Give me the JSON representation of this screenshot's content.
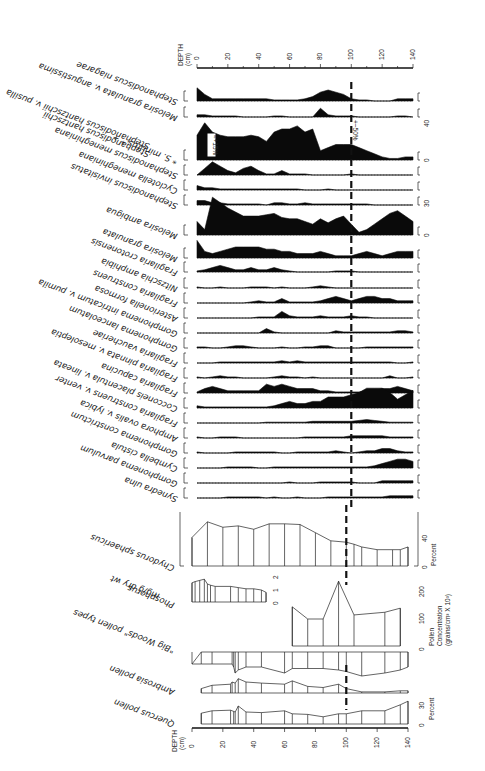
{
  "figure": {
    "orientation": "rotated 180 degrees",
    "depth_axis_label": "DEPTH",
    "depth_axis_unit": "(cm)",
    "depth_ticks": [
      "0",
      "20",
      "40",
      "60",
      "80",
      "100",
      "120",
      "140"
    ],
    "marker_depth": 100,
    "annotation_main": "+~50%",
    "annotation_box": "≈+15%",
    "percent_label": "Percent",
    "pollen_conc_label_1": "Pollen",
    "pollen_conc_label_2": "Concentration",
    "pollen_conc_label_3": "(grains/cm³ X 10³)"
  },
  "chart_data": {
    "type": "area",
    "xlabel": "DEPTH (cm)",
    "xlim": [
      0,
      140
    ],
    "depths": [
      0,
      5,
      10,
      15,
      20,
      25,
      30,
      35,
      40,
      45,
      50,
      55,
      60,
      65,
      70,
      75,
      80,
      85,
      90,
      95,
      100,
      105,
      110,
      115,
      120,
      125,
      130,
      135,
      140
    ],
    "diatoms": [
      {
        "name": "Stephanodiscus niagarae",
        "values": [
          6,
          3,
          1,
          1,
          1,
          1,
          1,
          1,
          1,
          1,
          0.5,
          0.5,
          0.5,
          0.5,
          1,
          2,
          4,
          5,
          4,
          3,
          1,
          0.5,
          0.5,
          0,
          0,
          0,
          1,
          1,
          1
        ]
      },
      {
        "name": "Melosira granulata v. angustissima",
        "values": [
          1,
          1,
          0.5,
          0.5,
          0.5,
          0.5,
          0,
          0,
          0,
          0,
          0.5,
          0.5,
          0,
          0,
          0,
          0,
          4,
          1,
          0.5,
          0.5,
          0.5,
          0,
          0,
          0,
          0,
          0,
          0.5,
          0.5,
          0
        ]
      },
      {
        "name": "* S. minutus * +",
        "values": [
          16,
          24,
          18,
          16,
          15,
          15,
          15,
          16,
          15,
          12,
          18,
          20,
          20,
          22,
          18,
          20,
          6,
          8,
          10,
          10,
          10,
          8,
          6,
          4,
          2,
          1,
          1,
          2,
          2
        ]
      },
      {
        "name": "Stephanodiscus hantzschii",
        "values": []
      },
      {
        "name": "Stephanodiscus hantzschii v. pusilla",
        "values": []
      },
      {
        "name": "Stephanodiscus meneghiniana",
        "values": [
          0,
          3,
          6,
          4,
          2,
          1,
          3,
          4,
          2,
          0.5,
          0.5,
          2,
          0.5,
          0.5,
          0.5,
          0,
          0,
          0,
          0,
          0,
          0.5,
          0,
          0,
          0,
          0,
          0,
          0,
          0,
          0
        ]
      },
      {
        "name": "Cyclotella meneghiniana",
        "values": [
          2,
          1,
          1,
          0.5,
          0.5,
          0.5,
          0.5,
          0.5,
          0.5,
          0.5,
          0.5,
          0.5,
          0.5,
          0.5,
          0,
          0,
          0,
          0.5,
          0,
          0,
          0,
          0,
          0,
          0,
          0,
          0,
          0,
          0,
          0
        ]
      },
      {
        "name": "Stephanodiscus invisitatus",
        "values": [
          2,
          2,
          1,
          1,
          0.5,
          0.5,
          0.5,
          0.5,
          0.5,
          0,
          1,
          1,
          0.5,
          0.5,
          1,
          0.5,
          0.5,
          0.5,
          0.5,
          0.5,
          0.5,
          0.5,
          0.5,
          0,
          0,
          0,
          0,
          0,
          0
        ]
      },
      {
        "name": "Melosira ambigua",
        "values": [
          10,
          4,
          28,
          24,
          20,
          17,
          14,
          14,
          14,
          15,
          16,
          13,
          12,
          12,
          10,
          8,
          12,
          9,
          12,
          14,
          8,
          2,
          4,
          8,
          12,
          16,
          18,
          14,
          10
        ]
      },
      {
        "name": "Melosira granulata",
        "values": [
          8,
          3,
          2,
          3,
          4,
          5,
          5,
          5,
          5,
          4,
          4,
          3,
          3,
          2,
          2,
          2,
          3,
          2,
          1,
          1,
          1,
          2,
          3,
          2,
          1,
          2,
          3,
          3,
          3
        ]
      },
      {
        "name": "Fragilaria crotonensis",
        "values": [
          0.5,
          1,
          2,
          3,
          2,
          1,
          1,
          2,
          1,
          1,
          2,
          1,
          0.5,
          0,
          0,
          0,
          0,
          0,
          0.5,
          0.5,
          0.5,
          0,
          0,
          0,
          0,
          0,
          0,
          0,
          0
        ]
      },
      {
        "name": "Nitzschia amphibia",
        "values": [
          0.5,
          0,
          0,
          0.5,
          0,
          0,
          0,
          0.5,
          0.5,
          0.5,
          0,
          0.5,
          0,
          0,
          0,
          0.5,
          1,
          0.5,
          0,
          0,
          0,
          0,
          0,
          0,
          0,
          0,
          0,
          0,
          0
        ]
      },
      {
        "name": "Fragilaria construens",
        "values": [
          0,
          0,
          0,
          0,
          0,
          0,
          0,
          0.5,
          1,
          0.5,
          0.5,
          2,
          0.5,
          0.5,
          0.5,
          0.5,
          1,
          2,
          3,
          2,
          1,
          2,
          3,
          3,
          2,
          2,
          1,
          1,
          1
        ]
      },
      {
        "name": "Asterionella formosa",
        "values": [
          0,
          0,
          0,
          0,
          0,
          0,
          0,
          0,
          0.5,
          0.5,
          0.5,
          3,
          1,
          0.5,
          0.5,
          0.5,
          1,
          0.5,
          0.5,
          0.5,
          1,
          0.5,
          0.5,
          0,
          0,
          0,
          0,
          0,
          0
        ]
      },
      {
        "name": "Gomphonema intricatum v. pumila",
        "values": [
          0,
          0,
          0,
          0,
          0,
          0,
          0,
          0,
          0,
          2,
          0.5,
          0,
          0,
          0,
          0,
          0,
          0,
          0,
          1,
          0.5,
          0.5,
          0.5,
          0.5,
          0.5,
          0.5,
          0.5,
          1,
          1,
          0.5
        ]
      },
      {
        "name": "Gomphonema lanceolatum",
        "values": [
          0.5,
          0.5,
          0,
          0,
          0.5,
          1,
          1,
          0.5,
          0,
          0,
          0,
          0.5,
          0,
          0,
          0.5,
          0.5,
          1,
          1,
          0,
          0,
          0,
          0,
          0.5,
          0.5,
          0.5,
          0.5,
          0.5,
          0.5,
          0.5
        ]
      },
      {
        "name": "Fragilaria vaucheriae",
        "values": [
          0,
          0,
          0,
          0.5,
          0.5,
          0.5,
          0.5,
          0.5,
          0.5,
          0.5,
          0.5,
          1,
          0.5,
          1,
          0.5,
          0.5,
          0.5,
          0.5,
          0.5,
          0.5,
          0.5,
          0.5,
          0.5,
          0.5,
          0.5,
          0.5,
          0,
          0,
          0.5
        ]
      },
      {
        "name": "Fragilaria pinnata v. mesoleptia",
        "values": [
          0.5,
          0,
          0.5,
          1,
          0.5,
          0.5,
          0,
          0,
          0,
          0,
          0.5,
          1,
          0.5,
          0.5,
          0,
          0.5,
          0,
          0,
          0,
          0,
          0,
          0,
          0,
          0,
          0,
          1,
          0,
          0,
          0.5
        ]
      },
      {
        "name": "Fragilaria capucina",
        "values": [
          0.5,
          2,
          3,
          2,
          1,
          1,
          1,
          1,
          1,
          4,
          3,
          4,
          3,
          2,
          2,
          2,
          1,
          1,
          0.5,
          0.5,
          0.5,
          0.5,
          1,
          1,
          2,
          2,
          3,
          2,
          1
        ]
      },
      {
        "name": "Cocconeis placentula v. lineata",
        "values": [
          1,
          0.5,
          0.5,
          0.5,
          0.5,
          0.5,
          0.5,
          0.5,
          0.5,
          0.5,
          1,
          2,
          3,
          2,
          2,
          3,
          3,
          5,
          5,
          5,
          6,
          7,
          9,
          9,
          9,
          7,
          4,
          6,
          8
        ]
      },
      {
        "name": "Fragilaria construens v. venter",
        "values": [
          0,
          0,
          0,
          0,
          0,
          0,
          0,
          0,
          0,
          0.5,
          0.5,
          0.5,
          0.5,
          0.5,
          0.5,
          1,
          1,
          1,
          1,
          1,
          1,
          1.5,
          2,
          1.5,
          1,
          0.5,
          0.5,
          0.5,
          0.5
        ]
      },
      {
        "name": "Amphora ovalis v. lybica",
        "values": [
          0.5,
          0,
          0,
          0.5,
          0.5,
          0.5,
          0,
          0,
          0,
          0,
          0,
          0,
          0,
          0,
          0.5,
          0.5,
          0.5,
          0.5,
          0.5,
          0.5,
          1,
          1,
          1,
          1,
          1,
          0.5,
          0.5,
          0.5,
          0.5
        ]
      },
      {
        "name": "Gomphonema constrictum",
        "values": [
          0.5,
          0,
          0,
          0,
          0,
          0.5,
          0.5,
          0.5,
          0.5,
          0.5,
          0.5,
          0,
          0,
          0.5,
          0.5,
          0.5,
          0.5,
          0.5,
          1,
          0.5,
          0,
          0.5,
          1,
          1,
          2,
          2,
          1,
          0.5,
          0.5
        ]
      },
      {
        "name": "Cymbella cistula",
        "values": [
          0,
          0,
          0,
          0,
          0.5,
          0.5,
          0.5,
          0.5,
          0,
          0,
          0.5,
          0.5,
          0.5,
          0.5,
          0.5,
          0.5,
          0.5,
          0.5,
          0.5,
          0.5,
          0.5,
          0.5,
          0.5,
          1,
          2,
          3,
          4,
          4,
          3
        ]
      },
      {
        "name": "Gomphonema parvulum",
        "values": [
          0,
          0,
          0,
          0,
          0,
          0,
          0,
          0,
          0,
          0,
          0,
          0,
          0.5,
          0,
          0,
          0,
          0.5,
          0.5,
          0.5,
          0.5,
          0.5,
          0,
          0,
          0,
          1,
          1,
          1,
          1,
          1
        ]
      },
      {
        "name": "Synedra ulna",
        "values": [
          0,
          0,
          0,
          0,
          0.5,
          0.5,
          0.5,
          0.5,
          0.5,
          0,
          0.5,
          0,
          0,
          0.5,
          0,
          0,
          0,
          0.5,
          0.5,
          0.5,
          0.5,
          0.5,
          0.5,
          0.5,
          0.5,
          1,
          1,
          1,
          1
        ]
      }
    ],
    "chydorus_sphaericus_percent": {
      "depths": [
        0,
        10,
        20,
        30,
        40,
        50,
        60,
        70,
        80,
        90,
        100,
        105,
        110,
        120,
        130,
        135,
        140
      ],
      "values": [
        42,
        65,
        57,
        59,
        54,
        62,
        62,
        61,
        49,
        37,
        35,
        32,
        28,
        24,
        24,
        24,
        28
      ],
      "ylim": [
        0,
        80
      ],
      "ticks": [
        "0",
        "40"
      ]
    },
    "phosphorus_mg_per_g_dry_wt": {
      "depths": [
        0,
        2,
        5,
        8,
        10,
        12,
        15,
        25,
        30,
        35,
        40,
        45,
        48
      ],
      "values": [
        1.6,
        1.7,
        1.8,
        1.9,
        1.5,
        1.4,
        1.3,
        1.3,
        1.2,
        1.1,
        1.1,
        1.0,
        0.8
      ],
      "ylim": [
        0,
        2
      ],
      "ticks": [
        "0",
        "1",
        "2"
      ]
    },
    "pollen_concentration": {
      "depths": [
        65,
        75,
        85,
        95,
        105,
        125,
        135
      ],
      "values": [
        145,
        100,
        100,
        240,
        115,
        125,
        140
      ],
      "ylim": [
        0,
        200
      ],
      "ticks": [
        "0",
        "100",
        "200"
      ]
    },
    "big_woods_pollen_types": {
      "depths": [
        0,
        6,
        13,
        26,
        27,
        28,
        30,
        35,
        45,
        60,
        65,
        75,
        85,
        95,
        100,
        110,
        125,
        135,
        140
      ],
      "values": [
        14,
        14,
        14,
        14,
        12,
        8,
        10,
        12,
        12,
        8,
        11,
        11,
        11,
        10,
        9,
        6,
        8,
        10,
        12
      ]
    },
    "ambrosia_pollen": {
      "depths": [
        6,
        13,
        25,
        26,
        28,
        30,
        35,
        45,
        60,
        65,
        75,
        85,
        95,
        100,
        110,
        125,
        135,
        140
      ],
      "values": [
        4,
        7,
        8,
        10,
        9,
        13,
        10,
        9,
        8,
        11,
        6,
        5,
        8,
        4,
        1,
        1,
        2,
        2
      ]
    },
    "quercus_pollen_percent": {
      "depths": [
        6,
        13,
        25,
        27,
        28,
        30,
        35,
        45,
        60,
        65,
        75,
        85,
        95,
        100,
        110,
        125,
        135,
        140
      ],
      "values": [
        18,
        22,
        23,
        21,
        20,
        30,
        20,
        19,
        22,
        17,
        16,
        12,
        17,
        17,
        22,
        22,
        32,
        38
      ],
      "ylim": [
        0,
        40
      ],
      "ticks": [
        "0",
        "30"
      ]
    }
  }
}
